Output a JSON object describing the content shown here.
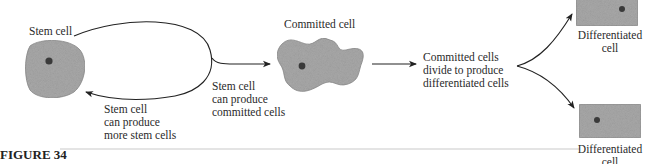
{
  "figure": {
    "caption": "FIGURE 34"
  },
  "nodes": {
    "stem_cell": {
      "label": "Stem cell"
    },
    "committed_cell": {
      "label": "Committed cell"
    },
    "differentiated_top": {
      "label_line1": "Differentiated",
      "label_line2": "cell"
    },
    "differentiated_bottom": {
      "label_line1": "Differentiated",
      "label_line2": "cell"
    }
  },
  "edges": {
    "self_renewal": {
      "line1": "Stem cell",
      "line2": "can produce",
      "line3": "more stem cells"
    },
    "commitment": {
      "line1": "Stem cell",
      "line2": "can produce",
      "line3": "committed cells"
    },
    "differentiation": {
      "line1": "Committed cells",
      "line2": "divide to produce",
      "line3": "differentiated cells"
    }
  },
  "colors": {
    "cell_fill": "#a9a9a9",
    "nucleus": "#3a3a3a",
    "line": "#222222",
    "rule": "#bbbbbb"
  }
}
